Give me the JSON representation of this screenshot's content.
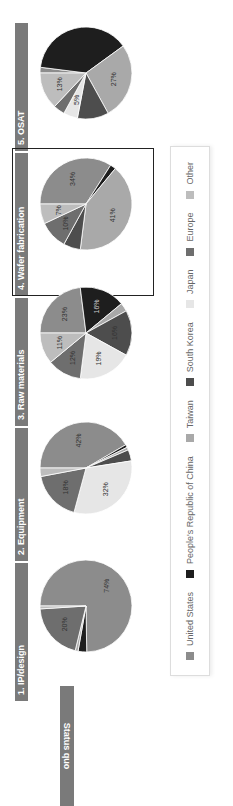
{
  "row_label": "Status quo",
  "highlighted_panel": "4. Wafer fabrication",
  "legend": [
    {
      "label": "United States",
      "color": "#8c8c8c"
    },
    {
      "label": "People's Republic of China",
      "color": "#1e1e1e"
    },
    {
      "label": "Taiwan",
      "color": "#a9a9a9"
    },
    {
      "label": "South Korea",
      "color": "#4d4d4d"
    },
    {
      "label": "Japan",
      "color": "#e6e6e6"
    },
    {
      "label": "Europe",
      "color": "#6e6e6e"
    },
    {
      "label": "Other",
      "color": "#bdbdbd"
    }
  ],
  "panels": [
    {
      "title": "1. IP/design"
    },
    {
      "title": "2. Equipment"
    },
    {
      "title": "3. Raw materials"
    },
    {
      "title": "4. Wafer fabrication"
    },
    {
      "title": "5. OSAT"
    }
  ],
  "chart_data": {
    "type": "pie",
    "title": "Status quo",
    "categories": [
      "United States",
      "People's Republic of China",
      "Taiwan",
      "South Korea",
      "Japan",
      "Europe",
      "Other"
    ],
    "charts": [
      {
        "title": "1. IP/design",
        "values": [
          74,
          3,
          1,
          0,
          0,
          20,
          1
        ],
        "labels": [
          "74%",
          "",
          "1%",
          "0%",
          "0%",
          "20%",
          "1%"
        ]
      },
      {
        "title": "2. Equipment",
        "values": [
          42,
          1,
          1,
          4,
          32,
          18,
          3
        ],
        "labels": [
          "42%",
          "1%",
          "1%",
          "4%",
          "32%",
          "18%",
          "3%"
        ]
      },
      {
        "title": "3. Raw materials",
        "values": [
          23,
          16,
          3,
          16,
          19,
          12,
          11
        ],
        "labels": [
          "23%",
          "16%",
          "3%",
          "16%",
          "19%",
          "12%",
          "11%"
        ]
      },
      {
        "title": "4. Wafer fabrication",
        "values": [
          34,
          2,
          41,
          6,
          0,
          10,
          7
        ],
        "labels": [
          "34%",
          "2%",
          "41%",
          "",
          "0%",
          "10%",
          "7%"
        ]
      },
      {
        "title": "5. OSAT",
        "values": [
          2,
          38,
          27,
          11,
          5,
          4,
          13
        ],
        "labels": [
          "2%",
          "",
          "27%",
          "",
          "5%",
          "4%",
          "13%"
        ]
      }
    ],
    "legend_position": "bottom"
  }
}
